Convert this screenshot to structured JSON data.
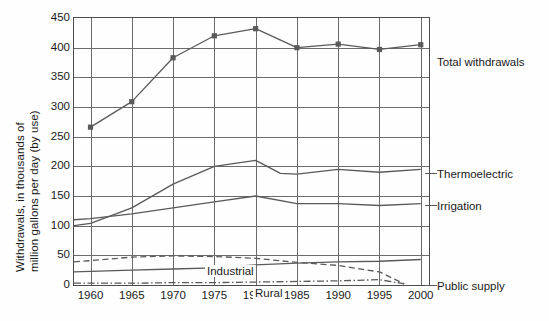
{
  "axis": {
    "y_title_line1": "Withdrawals, in thousands of",
    "y_title_line2": "million gallons per day (by use)",
    "y_ticks": [
      "450",
      "400",
      "350",
      "300",
      "250",
      "200",
      "150",
      "100",
      "50",
      "0"
    ],
    "x_ticks": [
      "1960",
      "1965",
      "1970",
      "1975",
      "1980",
      "1985",
      "1990",
      "1995",
      "2000"
    ]
  },
  "labels": {
    "total": "Total withdrawals",
    "thermoelectric": "Thermoelectric",
    "irrigation": "Irrigation",
    "public_supply": "Public supply",
    "industrial": "Industrial",
    "rural": "Rural"
  },
  "colors": {
    "line": "#5a5a5a",
    "frame": "#4c4c4c",
    "grid": "#6b6b6b",
    "text": "#1a1a1a"
  },
  "chart_data": {
    "type": "line",
    "title": "",
    "xlabel": "",
    "ylabel": "Withdrawals, in thousands of million gallons per day (by use)",
    "xlim": [
      1958,
      2001
    ],
    "ylim": [
      0,
      450
    ],
    "ytick_step": 50,
    "xtick_step": 5,
    "grid": true,
    "legend": "right-side inline labels",
    "series": [
      {
        "name": "Total withdrawals",
        "style": "solid-with-square-markers",
        "markers": true,
        "x": [
          1960,
          1965,
          1970,
          1975,
          1980,
          1985,
          1990,
          1995,
          2000
        ],
        "values": [
          266,
          309,
          383,
          420,
          432,
          400,
          406,
          397,
          405
        ]
      },
      {
        "name": "Thermoelectric",
        "style": "solid",
        "markers": false,
        "x": [
          1958,
          1960,
          1965,
          1970,
          1975,
          1980,
          1983,
          1985,
          1990,
          1995,
          2000
        ],
        "values": [
          100,
          104,
          130,
          170,
          200,
          210,
          188,
          187,
          195,
          190,
          195
        ]
      },
      {
        "name": "Irrigation",
        "style": "solid",
        "markers": false,
        "x": [
          1958,
          1960,
          1965,
          1970,
          1975,
          1980,
          1985,
          1990,
          1995,
          2000
        ],
        "values": [
          110,
          112,
          120,
          130,
          140,
          150,
          137,
          137,
          134,
          137
        ]
      },
      {
        "name": "Public supply",
        "style": "solid",
        "markers": false,
        "x": [
          1958,
          1960,
          1965,
          1970,
          1975,
          1980,
          1985,
          1990,
          1995,
          2000
        ],
        "values": [
          22,
          23,
          25,
          27,
          29,
          34,
          37,
          39,
          40,
          43
        ]
      },
      {
        "name": "Industrial",
        "style": "dashed",
        "markers": false,
        "x": [
          1958,
          1960,
          1965,
          1970,
          1975,
          1980,
          1985,
          1990,
          1995,
          1998
        ],
        "values": [
          39,
          41,
          47,
          49,
          48,
          45,
          38,
          33,
          22,
          2
        ]
      },
      {
        "name": "Rural",
        "style": "dash-dot",
        "markers": false,
        "x": [
          1958,
          1960,
          1965,
          1970,
          1975,
          1980,
          1985,
          1990,
          1995,
          1998
        ],
        "values": [
          3,
          3,
          3,
          4,
          4,
          5,
          6,
          7,
          9,
          2
        ]
      }
    ]
  }
}
